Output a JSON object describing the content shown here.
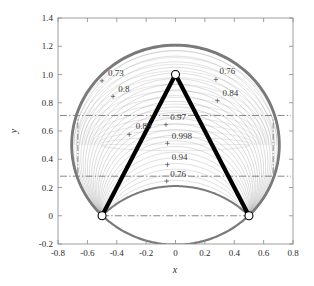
{
  "chart_data": {
    "type": "line",
    "title": "",
    "xlabel": "x",
    "ylabel": "y",
    "xlim": [
      -0.8,
      0.8
    ],
    "ylim": [
      -0.2,
      1.4
    ],
    "xticks": [
      -0.8,
      -0.6,
      -0.4,
      -0.2,
      0,
      0.2,
      0.4,
      0.6,
      0.8
    ],
    "xticklabels": [
      "-0.8",
      "-0.6",
      "-0.4",
      "-0.2",
      "0",
      "0.2",
      "0.4",
      "0.6",
      "0.8"
    ],
    "yticks": [
      -0.2,
      0,
      0.2,
      0.4,
      0.6,
      0.8,
      1.0,
      1.2,
      1.4
    ],
    "yticklabels": [
      "-0.2",
      "0",
      "0.2",
      "0.4",
      "0.6",
      "0.8",
      "1.0",
      "1.2",
      "1.4"
    ],
    "grid": false,
    "legend": null,
    "contour_labels": [
      {
        "text": "0.73",
        "x": -0.46,
        "y": 0.99,
        "marker_x": -0.5,
        "marker_y": 0.955
      },
      {
        "text": "0.8",
        "x": -0.39,
        "y": 0.875,
        "marker_x": -0.425,
        "marker_y": 0.845
      },
      {
        "text": "0.76",
        "x": 0.3,
        "y": 1.005,
        "marker_x": 0.275,
        "marker_y": 0.965
      },
      {
        "text": "0.84",
        "x": 0.32,
        "y": 0.845,
        "marker_x": 0.285,
        "marker_y": 0.815
      },
      {
        "text": "0.89",
        "x": -0.27,
        "y": 0.615,
        "marker_x": -0.315,
        "marker_y": 0.575
      },
      {
        "text": "0.97",
        "x": -0.035,
        "y": 0.675,
        "marker_x": -0.065,
        "marker_y": 0.645
      },
      {
        "text": "0.998",
        "x": -0.025,
        "y": 0.545,
        "marker_x": -0.055,
        "marker_y": 0.513
      },
      {
        "text": "0.94",
        "x": -0.025,
        "y": 0.395,
        "marker_x": -0.055,
        "marker_y": 0.362
      },
      {
        "text": "0.76",
        "x": -0.035,
        "y": 0.275,
        "marker_x": -0.06,
        "marker_y": 0.245
      }
    ],
    "vertices": [
      {
        "label": "apex",
        "x": 0.0,
        "y": 1.0
      },
      {
        "label": "left-base",
        "x": -0.5,
        "y": 0.0
      },
      {
        "label": "right-base",
        "x": 0.5,
        "y": 0.0
      }
    ],
    "reference_lines": [
      {
        "orientation": "horizontal",
        "y": 0.71,
        "style": "dash-dot"
      },
      {
        "orientation": "horizontal",
        "y": 0.28,
        "style": "dash-dot"
      },
      {
        "orientation": "horizontal",
        "y": 0.0,
        "style": "dash-dot"
      }
    ],
    "outer_envelope": {
      "top_peak_y": 1.21,
      "bottom_trough_y": 0.21,
      "left_extent_x": -0.705,
      "right_extent_x": 0.705,
      "color": "#7a7a7a"
    },
    "contour_family_note": "Nested arc contours spanning between the two base vertices, spreading from the bottom trough up to the top envelope.",
    "series": [
      {
        "name": "outer-envelope-upper",
        "values": [
          1.21
        ]
      },
      {
        "name": "outer-envelope-lower",
        "values": [
          0.21
        ]
      },
      {
        "name": "triangle-path",
        "values": [
          1.0,
          0.0,
          0.0
        ]
      }
    ],
    "colors": {
      "envelope": "#7a7a7a",
      "contour": "#9a9a9a",
      "triangle": "#000000",
      "reference_line": "#555555",
      "axis": "#888888",
      "text": "#2b2b2b"
    }
  }
}
